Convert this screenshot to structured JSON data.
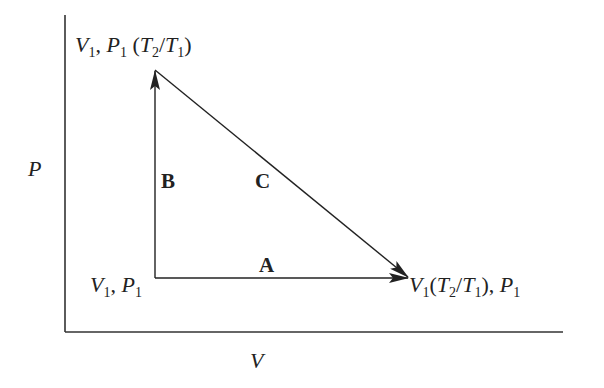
{
  "diagram": {
    "type": "P-V thermodynamic process diagram",
    "axes": {
      "x_label": "V",
      "y_label": "P"
    },
    "points": {
      "start": {
        "label": "V1, P1"
      },
      "top": {
        "label": "V1, P1 (T2/T1)"
      },
      "right": {
        "label": "V1 (T2/T1), P1"
      }
    },
    "paths": [
      {
        "name": "A",
        "from": "start",
        "to": "right",
        "direction": "horizontal"
      },
      {
        "name": "B",
        "from": "start",
        "to": "top",
        "direction": "vertical"
      },
      {
        "name": "C",
        "from": "top",
        "to": "right",
        "direction": "diagonal"
      }
    ],
    "colors": {
      "line": "#222222",
      "background": "#ffffff"
    }
  }
}
